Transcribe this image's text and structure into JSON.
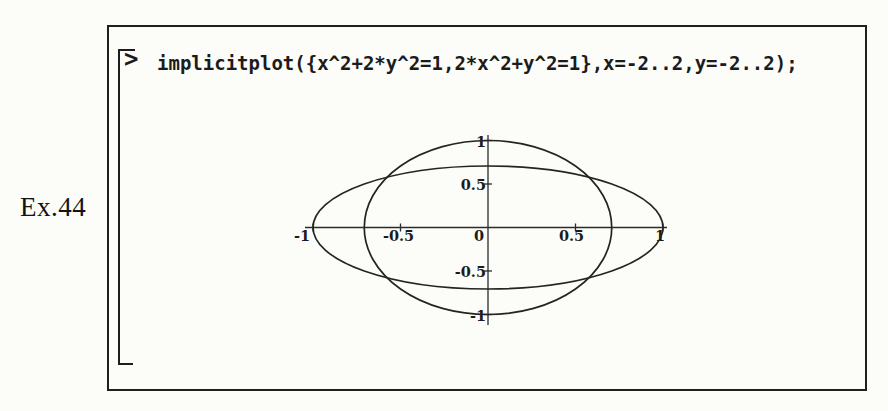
{
  "page": {
    "example_label": "Ex.44"
  },
  "colors": {
    "paper": "#fcfcf9",
    "ink": "#242424",
    "axis": "#2a2a2a"
  },
  "worksheet": {
    "prompt": ">",
    "command": "implicitplot({x^2+2*y^2=1,2*x^2+y^2=1},x=-2..2,y=-2..2);"
  },
  "chart_data": {
    "type": "line",
    "title": "",
    "xlabel": "",
    "ylabel": "",
    "equations": [
      "x^2+2*y^2=1",
      "2*x^2+y^2=1"
    ],
    "series": [
      {
        "name": "x^2+2*y^2=1",
        "shape": "ellipse",
        "center": [
          0,
          0
        ],
        "semi_axis_x": 1.0,
        "semi_axis_y": 0.7071
      },
      {
        "name": "2*x^2+y^2=1",
        "shape": "ellipse",
        "center": [
          0,
          0
        ],
        "semi_axis_x": 0.7071,
        "semi_axis_y": 1.0
      }
    ],
    "x_range_arg": "x=-2..2",
    "y_range_arg": "y=-2..2",
    "xlim": [
      -1.05,
      1.05
    ],
    "ylim": [
      -1.1,
      1.1
    ],
    "x_ticks": [
      -1,
      -0.5,
      0,
      0.5,
      1
    ],
    "x_tick_labels": [
      "-1",
      "-0.5",
      "0",
      "0.5",
      "1"
    ],
    "y_ticks": [
      1,
      0.5,
      -0.5,
      -1
    ],
    "y_tick_labels": [
      "1",
      "0.5",
      "-0.5",
      "-1"
    ],
    "grid": false,
    "legend": false,
    "axes_style": "cross-at-origin"
  }
}
